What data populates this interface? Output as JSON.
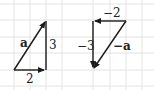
{
  "grid": {
    "cell": 16.5,
    "color": "#e3e3e3"
  },
  "colors": {
    "arrow": "#1a1a1a"
  },
  "left_figure": {
    "vector_label": "a",
    "horizontal_label": "2",
    "vertical_label": "3"
  },
  "right_figure": {
    "vector_label": "−a",
    "horizontal_label": "−2",
    "vertical_label": "−3"
  }
}
